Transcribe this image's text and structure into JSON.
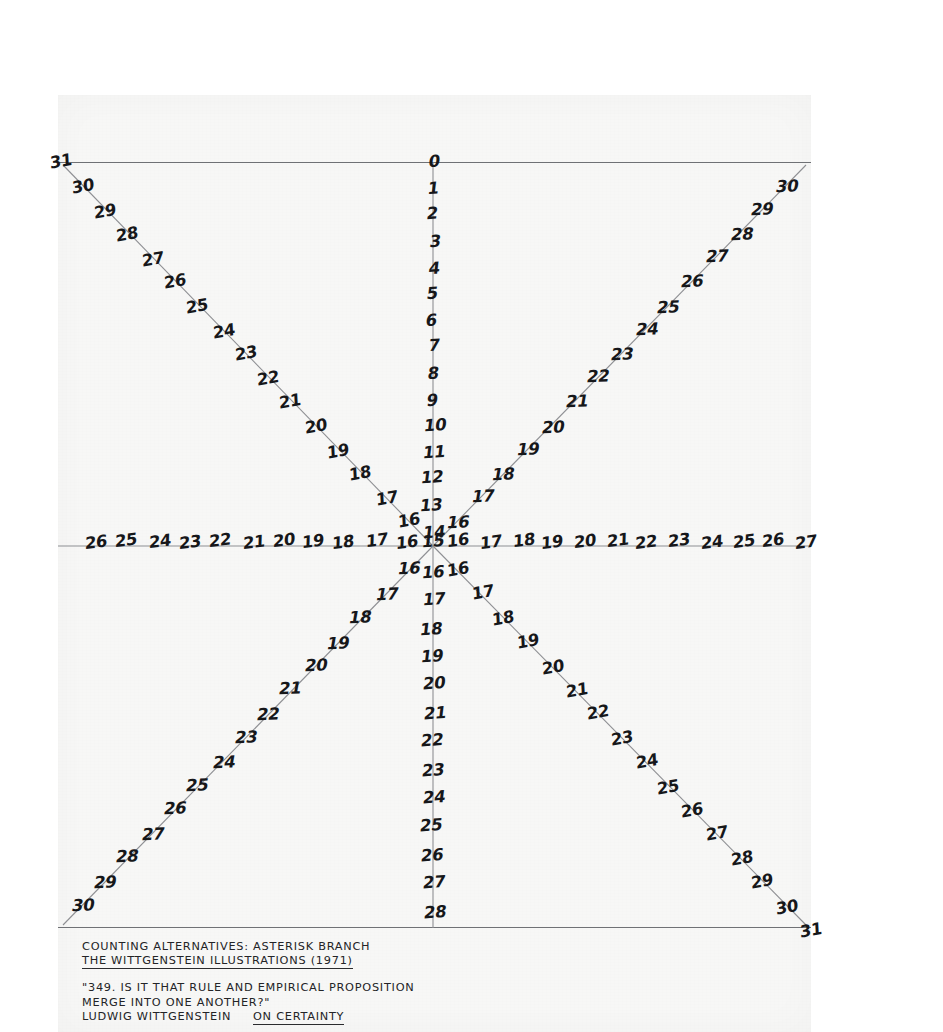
{
  "artwork": {
    "title": "COUNTING ALTERNATIVES: ASTERISK BRANCH",
    "series": "THE WITTGENSTEIN ILLUSTRATIONS (1971)",
    "quote_line1": "\"349.  IS IT THAT RULE AND EMPIRICAL PROPOSITION",
    "quote_line2": "MERGE INTO ONE ANOTHER?\"",
    "author": "LUDWIG WITTGENSTEIN",
    "source": "ON CERTAINTY"
  },
  "colors": {
    "paper": "#f7f7f6",
    "ink": "#16171a",
    "ray_line": "#8e8f93",
    "frame": "#6f7175",
    "page_background": "#ffffff"
  },
  "chart_data": {
    "type": "scatter",
    "title": "COUNTING ALTERNATIVES: ASTERISK BRANCH",
    "xlabel": "",
    "ylabel": "",
    "center_label": "15",
    "rays": [
      {
        "name": "up",
        "angle_deg": 90,
        "direction": "north",
        "labels": [
          "0",
          "1",
          "2",
          "3",
          "4",
          "5",
          "6",
          "7",
          "8",
          "9",
          "10",
          "11",
          "12",
          "13",
          "14"
        ],
        "order": "outer-to-inner",
        "min": 0,
        "max": 14
      },
      {
        "name": "down",
        "angle_deg": 270,
        "direction": "south",
        "labels": [
          "16",
          "17",
          "18",
          "19",
          "20",
          "21",
          "22",
          "23",
          "24",
          "25",
          "26",
          "27",
          "28"
        ],
        "order": "inner-to-outer",
        "min": 16,
        "max": 28
      },
      {
        "name": "left",
        "angle_deg": 180,
        "direction": "west",
        "labels": [
          "16",
          "17",
          "18",
          "19",
          "20",
          "21",
          "22",
          "23",
          "24",
          "25",
          "26"
        ],
        "order": "inner-to-outer",
        "min": 16,
        "max": 26
      },
      {
        "name": "right",
        "angle_deg": 0,
        "direction": "east",
        "labels": [
          "16",
          "17",
          "18",
          "19",
          "20",
          "21",
          "22",
          "23",
          "24",
          "25",
          "26",
          "27"
        ],
        "order": "inner-to-outer",
        "min": 16,
        "max": 27
      },
      {
        "name": "upper-left",
        "angle_deg": 135,
        "direction": "northwest",
        "labels": [
          "16",
          "17",
          "18",
          "19",
          "20",
          "21",
          "22",
          "23",
          "24",
          "25",
          "26",
          "27",
          "28",
          "29",
          "30",
          "31"
        ],
        "order": "inner-to-outer",
        "min": 16,
        "max": 31
      },
      {
        "name": "upper-right",
        "angle_deg": 45,
        "direction": "northeast",
        "labels": [
          "16",
          "17",
          "18",
          "19",
          "20",
          "21",
          "22",
          "23",
          "24",
          "25",
          "26",
          "27",
          "28",
          "29",
          "30"
        ],
        "order": "inner-to-outer",
        "min": 16,
        "max": 30
      },
      {
        "name": "lower-left",
        "angle_deg": 225,
        "direction": "southwest",
        "labels": [
          "16",
          "17",
          "18",
          "19",
          "20",
          "21",
          "22",
          "23",
          "24",
          "25",
          "26",
          "27",
          "28",
          "29",
          "30"
        ],
        "order": "inner-to-outer",
        "min": 16,
        "max": 30
      },
      {
        "name": "lower-right",
        "angle_deg": 315,
        "direction": "southeast",
        "labels": [
          "16",
          "17",
          "18",
          "19",
          "20",
          "21",
          "22",
          "23",
          "24",
          "25",
          "26",
          "27",
          "28",
          "29",
          "30",
          "31"
        ],
        "order": "inner-to-outer",
        "min": 16,
        "max": 31
      }
    ]
  }
}
